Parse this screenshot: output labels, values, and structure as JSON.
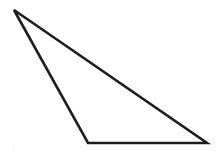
{
  "canvas": {
    "width": 216,
    "height": 156,
    "background_color": "#ffffff",
    "alt_text": "Obtuse scalene triangle outline"
  },
  "figure": {
    "name": "triangle",
    "type": "polygon",
    "stroke_color": "#1e1e1e",
    "fill_color": "#ffffff",
    "stroke_width": 2.6,
    "points": "14,10 88,143 207,143",
    "vertices": [
      {
        "label": "apex-top-left",
        "x": 14,
        "y": 10
      },
      {
        "label": "base-left",
        "x": 88,
        "y": 143
      },
      {
        "label": "base-right",
        "x": 207,
        "y": 143
      }
    ],
    "edges": [
      {
        "label": "left-edge",
        "from": "apex-top-left",
        "to": "base-left"
      },
      {
        "label": "base-edge",
        "from": "base-left",
        "to": "base-right"
      },
      {
        "label": "hypotenuse-edge",
        "from": "base-right",
        "to": "apex-top-left"
      }
    ]
  },
  "artifacts": {
    "speck": {
      "x": 11,
      "y": 144,
      "color": "#fbfbfb"
    }
  }
}
